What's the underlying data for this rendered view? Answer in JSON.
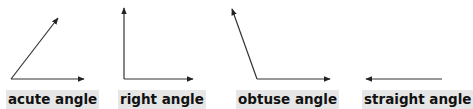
{
  "diagram": {
    "colors": {
      "line": "#333333",
      "label_bg": "#e6e6e6",
      "label_text": "#111111"
    },
    "angles": [
      {
        "id": "acute",
        "label": "acute angle"
      },
      {
        "id": "right",
        "label": "right angle"
      },
      {
        "id": "obtuse",
        "label": "obtuse angle"
      },
      {
        "id": "straight",
        "label": "straight angle"
      }
    ]
  }
}
